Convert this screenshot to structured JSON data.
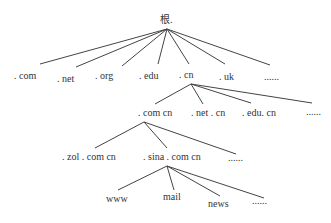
{
  "diagram": {
    "root": {
      "label": "根.",
      "x": 160,
      "y": 14
    },
    "level1": [
      {
        "label": ". com",
        "x": 14,
        "y": 72
      },
      {
        "label": ". net",
        "x": 57,
        "y": 74
      },
      {
        "label": ". org",
        "x": 95,
        "y": 71
      },
      {
        "label": ". edu",
        "x": 139,
        "y": 71
      },
      {
        "label": ". cn",
        "x": 178,
        "y": 70
      },
      {
        "label": ". uk",
        "x": 219,
        "y": 72
      },
      {
        "label": "......",
        "x": 263,
        "y": 73
      }
    ],
    "level2": [
      {
        "label": ". com cn",
        "x": 138,
        "y": 108
      },
      {
        "label": ". net . cn",
        "x": 191,
        "y": 108
      },
      {
        "label": ". edu. cn",
        "x": 242,
        "y": 108
      },
      {
        "label": "......",
        "x": 306,
        "y": 108
      }
    ],
    "level3": [
      {
        "label": ". zol . com cn",
        "x": 62,
        "y": 152
      },
      {
        "label": ". sina . com cn",
        "x": 143,
        "y": 152
      },
      {
        "label": "......",
        "x": 228,
        "y": 154
      }
    ],
    "level4": [
      {
        "label": "www",
        "x": 106,
        "y": 194
      },
      {
        "label": "mail",
        "x": 163,
        "y": 192
      },
      {
        "label": "news",
        "x": 208,
        "y": 199
      },
      {
        "label": "......",
        "x": 252,
        "y": 197
      }
    ],
    "line_color": "#444444"
  }
}
